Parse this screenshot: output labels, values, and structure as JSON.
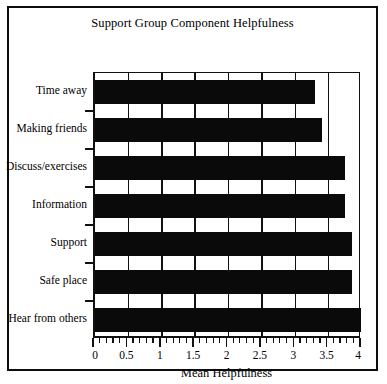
{
  "figure": {
    "title": "Support Group Component Helpfulness",
    "border_color": "#0d0d0d",
    "bar_color": "#0a0a0a",
    "background": "#ffffff"
  },
  "chart_data": {
    "type": "bar",
    "orientation": "horizontal",
    "title": "Support Group Component Helpfulness",
    "xlabel": "Mean Helpfulness",
    "ylabel": "",
    "categories": [
      "Time away",
      "Making friends",
      "Discuss/exercises",
      "Information",
      "Support",
      "Safe place",
      "Hear from others"
    ],
    "values": [
      3.3,
      3.4,
      3.75,
      3.75,
      3.85,
      3.85,
      3.98
    ],
    "xlim": [
      0,
      4
    ],
    "ylim": [
      0,
      7
    ],
    "xticks": [
      0,
      0.5,
      1,
      1.5,
      2,
      2.5,
      3,
      3.5,
      4
    ],
    "xtick_labels": [
      "0",
      "0.5",
      "1",
      "1.5",
      "2",
      "2.5",
      "3",
      "3.5",
      "4"
    ],
    "minor_tick_interval": 0.1,
    "grid": "vertical",
    "legend": null,
    "series": [
      {
        "name": "Mean Helpfulness",
        "values": [
          3.3,
          3.4,
          3.75,
          3.75,
          3.85,
          3.85,
          3.98
        ]
      }
    ]
  }
}
